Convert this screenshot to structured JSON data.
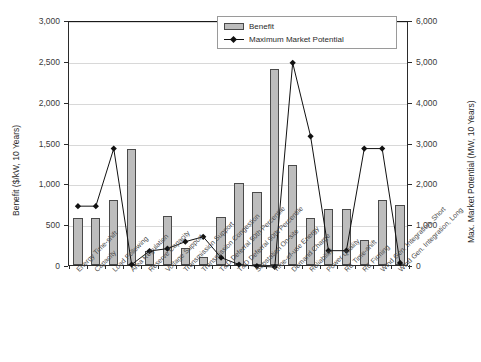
{
  "chart_data": {
    "type": "bar",
    "title": "",
    "xlabel": "",
    "ylabel": "Benefit ($/kW, 10 Years)",
    "y2label": "Max. Market Potential (MW, 10 Years)",
    "ylim": [
      0,
      3000
    ],
    "y2lim": [
      0,
      6000
    ],
    "grid": true,
    "legend_position": "top-center",
    "categories": [
      "Energy Time-shift",
      "Capacity",
      "Load Following",
      "Area Regulation",
      "Reserve Capacity",
      "Voltage Support",
      "Transmission Support",
      "Transmission Congestion",
      "T&D Deferral 50th Percentile",
      "T&D Deferral 90th Percentile",
      "Substation On-site",
      "Time-of-use Energy",
      "Demand Charge",
      "Reliability",
      "Power Quality",
      "RE Time-shift",
      "RE Firming",
      "Wind Gen. Integration, Short",
      "Wind Gen. Integration, Long"
    ],
    "series": [
      {
        "name": "Benefit",
        "axis": "left",
        "unit": "$/kW, 10 Years",
        "type": "bar",
        "color": "#bdbdbd",
        "values": [
          580,
          570,
          790,
          1420,
          170,
          600,
          210,
          100,
          590,
          1010,
          900,
          2400,
          1220,
          580,
          680,
          680,
          310,
          800,
          740
        ]
      },
      {
        "name": "Maximum Market Potential",
        "axis": "right",
        "unit": "MW, 10 Years",
        "type": "line",
        "color": "#111111",
        "marker": "diamond",
        "values": [
          1490,
          1490,
          2900,
          60,
          390,
          450,
          620,
          740,
          230,
          60,
          20,
          0,
          5000,
          3200,
          400,
          400,
          2900,
          2900,
          100
        ]
      }
    ],
    "y_ticks_left": [
      "0",
      "500",
      "1,000",
      "1,500",
      "2,000",
      "2,500",
      "3,000"
    ],
    "y_ticks_right": [
      "0",
      "1,000",
      "2,000",
      "3,000",
      "4,000",
      "5,000",
      "6,000"
    ]
  },
  "legend": {
    "items": [
      {
        "label": "Benefit",
        "type": "bar"
      },
      {
        "label": "Maximum Market Potential",
        "type": "line"
      }
    ]
  }
}
